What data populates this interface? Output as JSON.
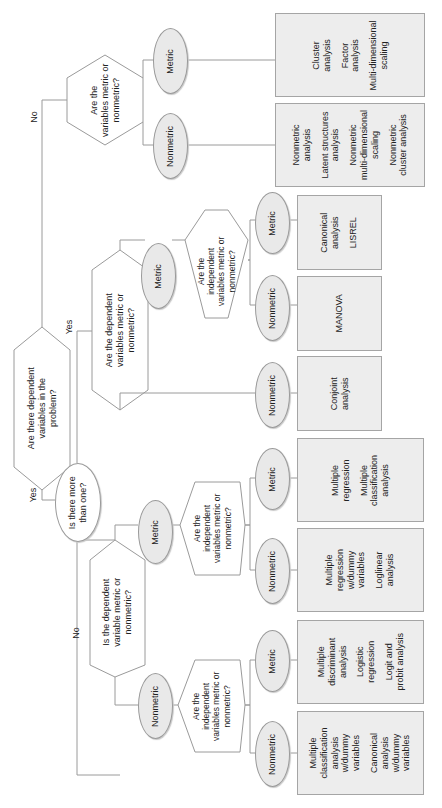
{
  "diagram": {
    "orientation": "rotated-90-ccw",
    "colors": {
      "line": "#9a9a9a",
      "box_fill": "#ededed",
      "oval_fill": "#e9e9e9",
      "hex_fill": "#ffffff"
    },
    "root": {
      "text_lines": [
        "Are there dependent",
        "variables in the",
        "problem?"
      ]
    },
    "edge_labels": {
      "root_no": "No",
      "root_yes": "Yes",
      "more_yes": "Yes",
      "more_no": "No",
      "upper_yes": "Yes"
    },
    "no_branch": {
      "question": [
        "Are the",
        "variables metric or",
        "nonmetric?"
      ],
      "metric_label": "Metric",
      "nonmetric_label": "Nonmetric",
      "metric_box": [
        "Cluster\nanalysis",
        "Factor\nanalysis",
        "Multi-dimensional\nscaling"
      ],
      "nonmetric_box": [
        "Nonmetric\nanalysis",
        "Latent structures\nanalysis",
        "Nonmetric\nmulti-dimensional\nscaling",
        "Nonmetric\ncluster analysis"
      ]
    },
    "more_than_one": {
      "question": [
        "Is there more",
        "than one?"
      ]
    },
    "multi_dependent": {
      "question": [
        "Are the dependent",
        "variables metric or",
        "nonmetric?"
      ],
      "metric_label": "Metric",
      "nonmetric_label": "Nonmetric",
      "nonmetric_box": [
        "Conjoint\nanalysis"
      ],
      "independent_question": [
        "Are the",
        "independent",
        "variables metric or",
        "nonmetric?"
      ],
      "ind_metric_label": "Metric",
      "ind_nonmetric_label": "Nonmetric",
      "ind_metric_box": [
        "Canonical\nanalysis",
        "LISREL"
      ],
      "ind_nonmetric_box": [
        "MANOVA"
      ]
    },
    "single_dependent": {
      "question": [
        "Is the dependent",
        "variable metric or",
        "nonmetric?"
      ],
      "metric_label": "Metric",
      "nonmetric_label": "Nonmetric",
      "metric_branch": {
        "question": [
          "Are the",
          "independent",
          "variables metric or",
          "nonmetric?"
        ],
        "metric_label": "Metric",
        "nonmetric_label": "Nonmetric",
        "metric_box": [
          "Multiple\nregression",
          "Multiple\nclassification\nanalysis"
        ],
        "nonmetric_box": [
          "Multiple\nregression\nw/dummy\nvariables",
          "Loglinear\nanalysis"
        ]
      },
      "nonmetric_branch": {
        "question": [
          "Are the",
          "independent",
          "variables metric or",
          "nonmetric?"
        ],
        "metric_label": "Metric",
        "nonmetric_label": "Nonmetric",
        "metric_box": [
          "Multiple\ndiscriminant\nanalysis",
          "Logistic\nregression",
          "Logit and\nprobit analysis"
        ],
        "nonmetric_box": [
          "Multiple\nclassification\nanalysis\nw/dummy\nvariables",
          "Canonical\nanalysis\nw/dummy\nvariables"
        ]
      }
    }
  }
}
